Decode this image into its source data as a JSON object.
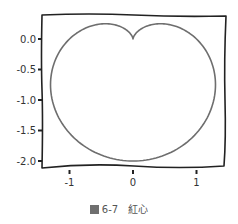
{
  "chart_data": {
    "type": "line",
    "style": "xkcd (hand-drawn)",
    "title": "",
    "xlabel": "",
    "ylabel": "",
    "curve": "cardioid r = 1 - sin(theta)",
    "series": [
      {
        "name": "cardioid",
        "color": "#6e6e6e",
        "description": "heart-shaped closed curve with cusp at (0,0), lowest point (0,-2), widest at x≈±1.3, top lobes at y≈0.25"
      }
    ],
    "xlim": [
      -1.45,
      1.45
    ],
    "ylim": [
      -2.1,
      0.4
    ],
    "xticks": [
      -1,
      0,
      1
    ],
    "xtick_labels": [
      "-1",
      "0",
      "1"
    ],
    "yticks": [
      0.0,
      -0.5,
      -1.0,
      -1.5,
      -2.0
    ],
    "ytick_labels": [
      "0.0",
      "-0.5",
      "-1.0",
      "-1.5",
      "-2.0"
    ],
    "grid": false,
    "legend": null
  },
  "caption": {
    "figure_number": "6-7",
    "text": "紅心"
  },
  "colors": {
    "curve": "#6e6e6e",
    "frame": "#222222",
    "text": "#333333"
  }
}
